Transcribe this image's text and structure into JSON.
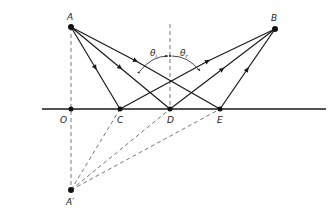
{
  "diagram": {
    "colors": {
      "line": "#1a1a1a",
      "dashed": "#555555",
      "background": "#ffffff"
    },
    "points": {
      "A": {
        "label": "A",
        "x": 71,
        "y": 27
      },
      "B": {
        "label": "B",
        "x": 275,
        "y": 29
      },
      "O": {
        "label": "O",
        "x": 71,
        "y": 109
      },
      "C": {
        "label": "C",
        "x": 120,
        "y": 109
      },
      "D": {
        "label": "D",
        "x": 170,
        "y": 109
      },
      "E": {
        "label": "E",
        "x": 220,
        "y": 109
      },
      "A_prime": {
        "label": "A′",
        "x": 71,
        "y": 190
      }
    },
    "mirror": {
      "x1": 42,
      "x2": 326,
      "y": 109
    },
    "angles": {
      "incident": {
        "symbol": "θ",
        "subscript": "i"
      },
      "reflected": {
        "symbol": "θ",
        "subscript": "r"
      }
    }
  }
}
